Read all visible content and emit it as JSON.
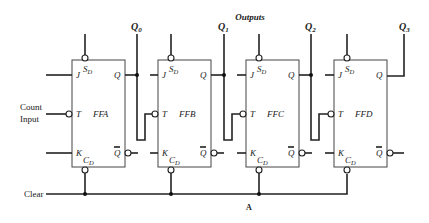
{
  "diagram": {
    "title": "Outputs",
    "figure_label": "A",
    "inputs": {
      "count_input_line1": "Count",
      "count_input_line2": "Input",
      "clear": "Clear"
    },
    "outputs": [
      {
        "label": "Q",
        "sub": "0"
      },
      {
        "label": "Q",
        "sub": "1"
      },
      {
        "label": "Q",
        "sub": "2"
      },
      {
        "label": "Q",
        "sub": "3"
      }
    ],
    "flipflops": [
      {
        "name": "FFA",
        "set": "S",
        "set_sub": "D",
        "clear": "C",
        "clear_sub": "D",
        "j": "J",
        "k": "K",
        "t": "T",
        "q": "Q",
        "qbar": "Q"
      },
      {
        "name": "FFB",
        "set": "S",
        "set_sub": "D",
        "clear": "C",
        "clear_sub": "D",
        "j": "J",
        "k": "K",
        "t": "T",
        "q": "Q",
        "qbar": "Q"
      },
      {
        "name": "FFC",
        "set": "S",
        "set_sub": "D",
        "clear": "C",
        "clear_sub": "D",
        "j": "J",
        "k": "K",
        "t": "T",
        "q": "Q",
        "qbar": "Q"
      },
      {
        "name": "FFD",
        "set": "S",
        "set_sub": "D",
        "clear": "C",
        "clear_sub": "D",
        "j": "J",
        "k": "K",
        "t": "T",
        "q": "Q",
        "qbar": "Q"
      }
    ]
  }
}
